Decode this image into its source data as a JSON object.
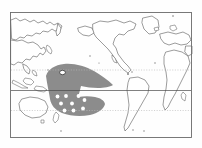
{
  "figure": {
    "kind": "world-distribution-map",
    "projection": "equirectangular, Pacific-centered",
    "background_color": "#fefefe",
    "frame": {
      "color": "#6b6b6b",
      "x": 10.5,
      "y": 12.5,
      "width": 181,
      "height": 125
    }
  },
  "chart_data": {
    "type": "map",
    "title": "",
    "subtitle": "",
    "xlabel": "",
    "ylabel": "",
    "grid": false,
    "legend_position": "none",
    "projection": "equirectangular",
    "center_longitude": 180,
    "xlim": [
      30,
      390
    ],
    "ylim": [
      -60,
      80
    ],
    "reference_lines": [
      {
        "name": "tropic-of-cancer",
        "latitude": 23.5,
        "style": "dotted",
        "color": "#b9b9b9",
        "y_px": 70.0
      },
      {
        "name": "equator",
        "latitude": 0,
        "style": "solid",
        "color": "#4a4a4a",
        "y_px": 90.5
      },
      {
        "name": "tropic-of-capricorn",
        "latitude": -23.5,
        "style": "dotted",
        "color": "#b9b9b9",
        "y_px": 110.5
      }
    ],
    "shaded_regions": [
      {
        "name": "pacific-range-polygon",
        "label": "",
        "fill_color": "#8c8c8c",
        "opacity": 1,
        "description": "wedge-shaped range across tropical central and western Pacific with a southern lobe"
      }
    ],
    "series": [
      {
        "name": "sampling-sites",
        "marker": "filled-circle",
        "marker_color": "#ffffff",
        "count": 9,
        "points": [
          {
            "label": "",
            "x_px": 57.5,
            "y_px": 96.5
          },
          {
            "label": "",
            "x_px": 66.0,
            "y_px": 96.0
          },
          {
            "label": "",
            "x_px": 78.5,
            "y_px": 96.0
          },
          {
            "label": "",
            "x_px": 61.0,
            "y_px": 103.5
          },
          {
            "label": "",
            "x_px": 72.0,
            "y_px": 103.5
          },
          {
            "label": "",
            "x_px": 84.5,
            "y_px": 100.0
          },
          {
            "label": "",
            "x_px": 64.5,
            "y_px": 110.5
          },
          {
            "label": "",
            "x_px": 73.5,
            "y_px": 110.5
          },
          {
            "label": "",
            "x_px": 83.0,
            "y_px": 108.5
          }
        ]
      },
      {
        "name": "highlighted-site",
        "marker": "outlined-circle",
        "marker_color": "#ffffff",
        "outline_color": "#2e2e2e",
        "count": 1,
        "points": [
          {
            "label": "",
            "x_px": 62.5,
            "y_px": 72.5
          }
        ]
      }
    ],
    "landmasses": [
      "Asia",
      "Siberia",
      "Japan",
      "Indonesia",
      "Philippines",
      "Australia",
      "New Zealand",
      "North America",
      "Greenland",
      "South America",
      "Africa",
      "Europe"
    ],
    "colors": {
      "land_fill": "#ffffff",
      "coastline": "#4a4a4a",
      "range_fill": "#8c8c8c",
      "site_fill": "#ffffff",
      "frame": "#6b6b6b",
      "equator": "#4a4a4a",
      "tropic": "#b9b9b9"
    }
  }
}
